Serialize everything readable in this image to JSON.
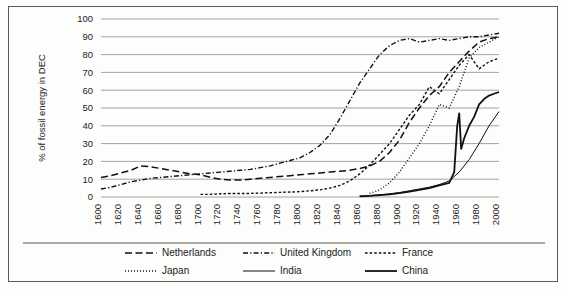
{
  "chart_data": {
    "type": "line",
    "title": "",
    "xlabel": "",
    "ylabel": "% of fossil energy in DEC",
    "xlim": [
      1600,
      2000
    ],
    "ylim": [
      0,
      100
    ],
    "grid": true,
    "legend_position": "bottom",
    "y_ticks": [
      "100",
      "90",
      "80",
      "70",
      "60",
      "50",
      "40",
      "30",
      "20",
      "10",
      "0"
    ],
    "x_ticks": [
      "1600",
      "1620",
      "1640",
      "1660",
      "1680",
      "1700",
      "1720",
      "1740",
      "1760",
      "1780",
      "1800",
      "1820",
      "1840",
      "1860",
      "1880",
      "1900",
      "1920",
      "1940",
      "1960",
      "1980",
      "2000"
    ],
    "series": [
      {
        "name": "Netherlands",
        "style": "dashed",
        "x": [
          1600,
          1610,
          1620,
          1630,
          1640,
          1650,
          1660,
          1670,
          1680,
          1690,
          1700,
          1710,
          1720,
          1730,
          1740,
          1750,
          1760,
          1770,
          1780,
          1790,
          1800,
          1810,
          1820,
          1830,
          1840,
          1850,
          1860,
          1870,
          1880,
          1890,
          1900,
          1910,
          1920,
          1930,
          1940,
          1950,
          1960,
          1970,
          1980,
          1990,
          2000
        ],
        "y": [
          11,
          12,
          13.5,
          15,
          17.5,
          17,
          16,
          15,
          14,
          13,
          12.5,
          11,
          10,
          9.5,
          9.5,
          10,
          10.5,
          11,
          11.5,
          12,
          12.5,
          13,
          13.5,
          14,
          14.5,
          15,
          16,
          17.5,
          20,
          25,
          32,
          42,
          50,
          57,
          62,
          70,
          76,
          82,
          87,
          89,
          90
        ]
      },
      {
        "name": "United Kingdom",
        "style": "dash-dot",
        "x": [
          1600,
          1610,
          1620,
          1630,
          1640,
          1650,
          1660,
          1670,
          1680,
          1690,
          1700,
          1710,
          1720,
          1730,
          1740,
          1750,
          1760,
          1770,
          1780,
          1790,
          1800,
          1810,
          1820,
          1830,
          1840,
          1850,
          1860,
          1870,
          1880,
          1890,
          1900,
          1910,
          1920,
          1930,
          1940,
          1950,
          1960,
          1970,
          1980,
          1990,
          2000
        ],
        "y": [
          4.5,
          5.5,
          7,
          8.5,
          9.5,
          10.5,
          11,
          11.5,
          12,
          12.5,
          13,
          13.5,
          14,
          14.5,
          15,
          15.5,
          16.5,
          17.5,
          19,
          20.5,
          22,
          25,
          29,
          35,
          44,
          54,
          64,
          72,
          80,
          85,
          88,
          89,
          87,
          88,
          89,
          88,
          89,
          90,
          90,
          91,
          92
        ]
      },
      {
        "name": "France",
        "style": "short-dash",
        "x": [
          1700,
          1710,
          1720,
          1730,
          1740,
          1750,
          1760,
          1770,
          1780,
          1790,
          1800,
          1810,
          1820,
          1830,
          1840,
          1850,
          1860,
          1870,
          1880,
          1890,
          1900,
          1910,
          1920,
          1930,
          1940,
          1950,
          1960,
          1970,
          1980,
          1990,
          2000
        ],
        "y": [
          1.5,
          1.5,
          1.8,
          2,
          2,
          2,
          2.2,
          2.4,
          2.6,
          2.8,
          3,
          3.5,
          4,
          5,
          6.5,
          9,
          13,
          18,
          24,
          30,
          38,
          46,
          52,
          62,
          58,
          66,
          74,
          80,
          72,
          76,
          78
        ]
      },
      {
        "name": "Japan",
        "style": "dotted",
        "x": [
          1870,
          1880,
          1890,
          1900,
          1910,
          1920,
          1930,
          1940,
          1950,
          1960,
          1970,
          1980,
          1990,
          2000
        ],
        "y": [
          2,
          4,
          8,
          14,
          22,
          30,
          40,
          52,
          50,
          62,
          78,
          84,
          87,
          90
        ]
      },
      {
        "name": "India",
        "style": "solid-thin",
        "x": [
          1860,
          1870,
          1880,
          1890,
          1900,
          1910,
          1920,
          1930,
          1940,
          1950,
          1960,
          1970,
          1980,
          1990,
          2000
        ],
        "y": [
          0.5,
          0.8,
          1.2,
          1.8,
          2.5,
          3.5,
          4.5,
          5.5,
          7,
          9,
          14,
          21,
          30,
          40,
          48
        ]
      },
      {
        "name": "China",
        "style": "solid-thick",
        "x": [
          1860,
          1870,
          1880,
          1890,
          1900,
          1910,
          1920,
          1930,
          1940,
          1950,
          1955,
          1958,
          1960,
          1962,
          1965,
          1970,
          1975,
          1980,
          1985,
          1990,
          1995,
          2000
        ],
        "y": [
          0.4,
          0.6,
          1,
          1.5,
          2.2,
          3,
          4,
          5,
          6.5,
          8,
          14,
          40,
          47,
          27,
          33,
          40,
          45,
          52,
          55,
          57,
          58,
          59
        ]
      }
    ]
  },
  "legend": {
    "items": [
      {
        "label": "Netherlands",
        "style": "dashed"
      },
      {
        "label": "United Kingdom",
        "style": "dash-dot"
      },
      {
        "label": "France",
        "style": "short-dash"
      },
      {
        "label": "Japan",
        "style": "dotted"
      },
      {
        "label": "India",
        "style": "solid-thin"
      },
      {
        "label": "China",
        "style": "solid-thick"
      }
    ]
  },
  "colors": {
    "line": "#111111",
    "grid": "#8c8c8c",
    "border": "#5a5a5a",
    "background": "#fdfdfb"
  }
}
